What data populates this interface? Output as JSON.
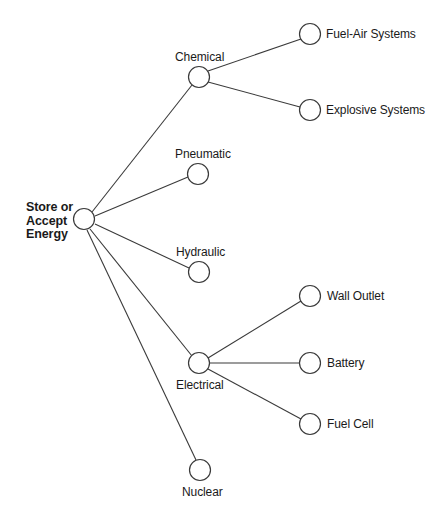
{
  "diagram": {
    "type": "node-link-tree",
    "style": {
      "background": "#ffffff",
      "edge_color": "#3a3a3a",
      "node_fill": "#ffffff",
      "node_stroke": "#3a3a3a",
      "text_color": "#1a1a1a"
    },
    "root": {
      "id": "store-or-accept-energy",
      "label": "Store or\nAccept\nEnergy",
      "label_lines": [
        "Store or",
        "Accept",
        "Energy"
      ],
      "bold": true,
      "cx": 84,
      "cy": 219,
      "r": 10.5,
      "label_x": 26,
      "label_y": 201,
      "label_align": "left"
    },
    "nodes": [
      {
        "id": "chemical",
        "label": "Chemical",
        "cx": 199,
        "cy": 77,
        "r": 10.5,
        "label_x": 175,
        "label_y": 51,
        "label_align": "left"
      },
      {
        "id": "fuel-air-systems",
        "label": "Fuel-Air Systems",
        "cx": 310,
        "cy": 34,
        "r": 10.5,
        "label_x": 326,
        "label_y": 28,
        "label_align": "left"
      },
      {
        "id": "explosive-systems",
        "label": "Explosive Systems",
        "cx": 310,
        "cy": 110,
        "r": 10.5,
        "label_x": 326,
        "label_y": 104,
        "label_align": "left"
      },
      {
        "id": "pneumatic",
        "label": "Pneumatic",
        "cx": 198,
        "cy": 174,
        "r": 10.5,
        "label_x": 175,
        "label_y": 148,
        "label_align": "left"
      },
      {
        "id": "hydraulic",
        "label": "Hydraulic",
        "cx": 199,
        "cy": 272,
        "r": 10.5,
        "label_x": 176,
        "label_y": 246,
        "label_align": "left"
      },
      {
        "id": "electrical",
        "label": "Electrical",
        "cx": 199,
        "cy": 363,
        "r": 10.5,
        "label_x": 176,
        "label_y": 379,
        "label_align": "left"
      },
      {
        "id": "wall-outlet",
        "label": "Wall Outlet",
        "cx": 310,
        "cy": 296,
        "r": 10.5,
        "label_x": 327,
        "label_y": 290,
        "label_align": "left"
      },
      {
        "id": "battery",
        "label": "Battery",
        "cx": 310,
        "cy": 363,
        "r": 10.5,
        "label_x": 327,
        "label_y": 357,
        "label_align": "left"
      },
      {
        "id": "fuel-cell",
        "label": "Fuel Cell",
        "cx": 310,
        "cy": 424,
        "r": 10.5,
        "label_x": 327,
        "label_y": 418,
        "label_align": "left"
      },
      {
        "id": "nuclear",
        "label": "Nuclear",
        "cx": 200,
        "cy": 470,
        "r": 10.5,
        "label_x": 182,
        "label_y": 486,
        "label_align": "left"
      }
    ],
    "edges": [
      {
        "from": "store-or-accept-energy",
        "to": "chemical",
        "x1": 92,
        "y1": 212,
        "x2": 192,
        "y2": 85
      },
      {
        "from": "store-or-accept-energy",
        "to": "pneumatic",
        "x1": 95,
        "y1": 216,
        "x2": 188,
        "y2": 177
      },
      {
        "from": "store-or-accept-energy",
        "to": "hydraulic",
        "x1": 95,
        "y1": 224,
        "x2": 189,
        "y2": 268
      },
      {
        "from": "store-or-accept-energy",
        "to": "electrical",
        "x1": 90,
        "y1": 229,
        "x2": 192,
        "y2": 356
      },
      {
        "from": "store-or-accept-energy",
        "to": "nuclear",
        "x1": 87,
        "y1": 230,
        "x2": 196,
        "y2": 460
      },
      {
        "from": "chemical",
        "to": "fuel-air-systems",
        "x1": 208,
        "y1": 71,
        "x2": 301,
        "y2": 39
      },
      {
        "from": "chemical",
        "to": "explosive-systems",
        "x1": 208,
        "y1": 82,
        "x2": 300,
        "y2": 107
      },
      {
        "from": "electrical",
        "to": "wall-outlet",
        "x1": 208,
        "y1": 358,
        "x2": 301,
        "y2": 301
      },
      {
        "from": "electrical",
        "to": "battery",
        "x1": 210,
        "y1": 363,
        "x2": 300,
        "y2": 363
      },
      {
        "from": "electrical",
        "to": "fuel-cell",
        "x1": 208,
        "y1": 369,
        "x2": 301,
        "y2": 419
      }
    ]
  }
}
